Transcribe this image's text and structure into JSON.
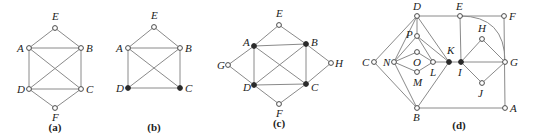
{
  "figure": {
    "panels": [
      {
        "id": "a",
        "caption": "(a)",
        "caption_pos": [
          55,
          131
        ],
        "nodes": [
          {
            "name": "E",
            "x": 55,
            "y": 28,
            "filled": false,
            "lx": 52,
            "ly": 20
          },
          {
            "name": "A",
            "x": 29,
            "y": 48,
            "filled": false,
            "lx": 17,
            "ly": 52
          },
          {
            "name": "B",
            "x": 81,
            "y": 48,
            "filled": false,
            "lx": 86,
            "ly": 52
          },
          {
            "name": "D",
            "x": 29,
            "y": 89,
            "filled": false,
            "lx": 17,
            "ly": 93
          },
          {
            "name": "C",
            "x": 81,
            "y": 89,
            "filled": false,
            "lx": 86,
            "ly": 93
          },
          {
            "name": "F",
            "x": 55,
            "y": 108,
            "filled": false,
            "lx": 52,
            "ly": 121
          }
        ],
        "edges": [
          [
            "E",
            "A"
          ],
          [
            "E",
            "B"
          ],
          [
            "A",
            "B"
          ],
          [
            "A",
            "D"
          ],
          [
            "B",
            "C"
          ],
          [
            "A",
            "C"
          ],
          [
            "B",
            "D"
          ],
          [
            "D",
            "C"
          ],
          [
            "D",
            "F"
          ],
          [
            "C",
            "F"
          ]
        ]
      },
      {
        "id": "b",
        "caption": "(b)",
        "caption_pos": [
          154,
          131
        ],
        "nodes": [
          {
            "name": "E",
            "x": 154,
            "y": 27,
            "filled": false,
            "lx": 151,
            "ly": 19
          },
          {
            "name": "A",
            "x": 128,
            "y": 48,
            "filled": false,
            "lx": 116,
            "ly": 52
          },
          {
            "name": "B",
            "x": 180,
            "y": 48,
            "filled": false,
            "lx": 185,
            "ly": 52
          },
          {
            "name": "D",
            "x": 128,
            "y": 88,
            "filled": true,
            "lx": 116,
            "ly": 92
          },
          {
            "name": "C",
            "x": 180,
            "y": 88,
            "filled": true,
            "lx": 185,
            "ly": 92
          }
        ],
        "edges": [
          [
            "E",
            "A"
          ],
          [
            "E",
            "B"
          ],
          [
            "A",
            "B"
          ],
          [
            "A",
            "D"
          ],
          [
            "B",
            "C"
          ],
          [
            "A",
            "C"
          ],
          [
            "B",
            "D"
          ],
          [
            "D",
            "C"
          ]
        ]
      },
      {
        "id": "c",
        "caption": "(c)",
        "caption_pos": [
          279,
          127
        ],
        "nodes": [
          {
            "name": "E",
            "x": 279,
            "y": 25,
            "filled": false,
            "lx": 276,
            "ly": 17
          },
          {
            "name": "A",
            "x": 254,
            "y": 46,
            "filled": true,
            "lx": 243,
            "ly": 46
          },
          {
            "name": "B",
            "x": 306,
            "y": 44,
            "filled": true,
            "lx": 311,
            "ly": 46
          },
          {
            "name": "G",
            "x": 228,
            "y": 65,
            "filled": false,
            "lx": 217,
            "ly": 69
          },
          {
            "name": "H",
            "x": 331,
            "y": 63,
            "filled": false,
            "lx": 335,
            "ly": 67
          },
          {
            "name": "D",
            "x": 254,
            "y": 85,
            "filled": true,
            "lx": 243,
            "ly": 91
          },
          {
            "name": "C",
            "x": 306,
            "y": 84,
            "filled": true,
            "lx": 311,
            "ly": 91
          },
          {
            "name": "F",
            "x": 279,
            "y": 104,
            "filled": false,
            "lx": 276,
            "ly": 117
          }
        ],
        "edges": [
          [
            "E",
            "A"
          ],
          [
            "E",
            "B"
          ],
          [
            "A",
            "B"
          ],
          [
            "A",
            "D"
          ],
          [
            "B",
            "C"
          ],
          [
            "A",
            "C"
          ],
          [
            "B",
            "D"
          ],
          [
            "D",
            "C"
          ],
          [
            "G",
            "A"
          ],
          [
            "G",
            "D"
          ],
          [
            "H",
            "B"
          ],
          [
            "H",
            "C"
          ],
          [
            "D",
            "F"
          ],
          [
            "C",
            "F"
          ]
        ]
      },
      {
        "id": "d",
        "caption": "(d)",
        "caption_pos": [
          459,
          129
        ],
        "nodes": [
          {
            "name": "D",
            "x": 417,
            "y": 16,
            "filled": false,
            "lx": 413,
            "ly": 10
          },
          {
            "name": "E",
            "x": 460,
            "y": 16,
            "filled": false,
            "lx": 456,
            "ly": 10
          },
          {
            "name": "F",
            "x": 504,
            "y": 16,
            "filled": false,
            "lx": 509,
            "ly": 20
          },
          {
            "name": "P",
            "x": 417,
            "y": 36,
            "filled": false,
            "lx": 406,
            "ly": 38
          },
          {
            "name": "O",
            "x": 417,
            "y": 52,
            "filled": false,
            "lx": 413,
            "ly": 66
          },
          {
            "name": "C",
            "x": 374,
            "y": 62,
            "filled": false,
            "lx": 362,
            "ly": 66
          },
          {
            "name": "N",
            "x": 394,
            "y": 62,
            "filled": false,
            "lx": 383,
            "ly": 66
          },
          {
            "name": "L",
            "x": 433,
            "y": 62,
            "filled": false,
            "lx": 430,
            "ly": 76
          },
          {
            "name": "K",
            "x": 449,
            "y": 62,
            "filled": true,
            "lx": 447,
            "ly": 54
          },
          {
            "name": "I",
            "x": 461,
            "y": 62,
            "filled": true,
            "lx": 458,
            "ly": 76
          },
          {
            "name": "H",
            "x": 482,
            "y": 39,
            "filled": false,
            "lx": 478,
            "ly": 32
          },
          {
            "name": "G",
            "x": 505,
            "y": 62,
            "filled": false,
            "lx": 510,
            "ly": 66
          },
          {
            "name": "J",
            "x": 482,
            "y": 83,
            "filled": false,
            "lx": 478,
            "ly": 97
          },
          {
            "name": "M",
            "x": 417,
            "y": 72,
            "filled": false,
            "lx": 413,
            "ly": 86
          },
          {
            "name": "B",
            "x": 417,
            "y": 108,
            "filled": false,
            "lx": 413,
            "ly": 121
          },
          {
            "name": "A",
            "x": 505,
            "y": 108,
            "filled": false,
            "lx": 510,
            "ly": 112
          }
        ],
        "edges": [
          [
            "D",
            "E"
          ],
          [
            "E",
            "F"
          ],
          [
            "F",
            "A"
          ],
          [
            "B",
            "A"
          ],
          [
            "E",
            "I"
          ],
          [
            "D",
            "C"
          ],
          [
            "C",
            "B"
          ],
          [
            "D",
            "P"
          ],
          [
            "D",
            "K"
          ],
          [
            "D",
            "N"
          ],
          [
            "N",
            "B"
          ],
          [
            "B",
            "K"
          ],
          [
            "P",
            "N"
          ],
          [
            "P",
            "L"
          ],
          [
            "P",
            "K"
          ],
          [
            "N",
            "O"
          ],
          [
            "O",
            "L"
          ],
          [
            "N",
            "M"
          ],
          [
            "M",
            "L"
          ],
          [
            "L",
            "K"
          ],
          [
            "K",
            "I"
          ],
          [
            "I",
            "G"
          ],
          [
            "I",
            "H"
          ],
          [
            "H",
            "G"
          ],
          [
            "I",
            "J"
          ],
          [
            "J",
            "G"
          ]
        ],
        "arcs": [
          {
            "from": "E",
            "to": "G",
            "path": "M460,16 Q505,16 505,62"
          }
        ]
      }
    ]
  }
}
